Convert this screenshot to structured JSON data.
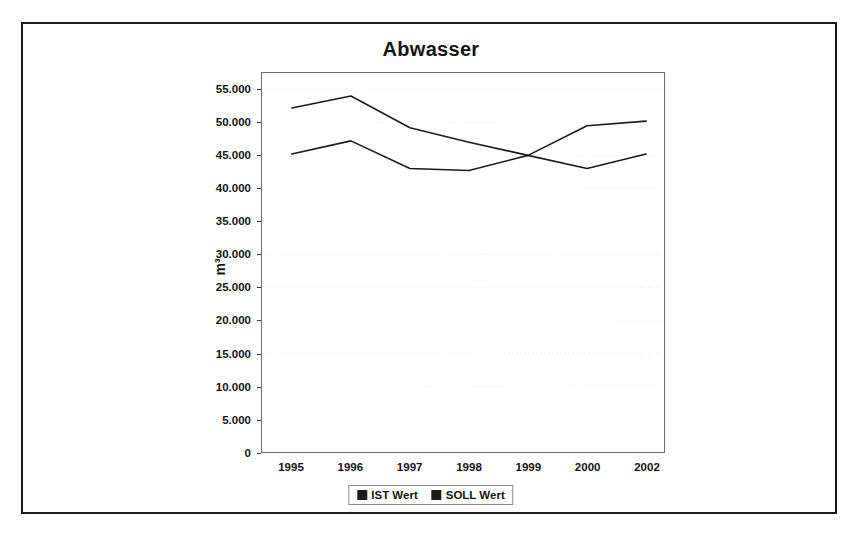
{
  "chart_data": {
    "type": "line",
    "title": "Abwasser",
    "xlabel": "",
    "ylabel": "m³",
    "categories": [
      "1995",
      "1996",
      "1997",
      "1998",
      "1999",
      "2000",
      "2002"
    ],
    "series": [
      {
        "name": "IST Wert",
        "color": "#1b1b1b",
        "values": [
          45200,
          47200,
          43000,
          42700,
          45000,
          43000,
          45200
        ]
      },
      {
        "name": "SOLL Wert",
        "color": "#1b1b1b",
        "values": [
          52200,
          54000,
          49200,
          47000,
          45000,
          49500,
          50200
        ]
      }
    ],
    "ylim": [
      0,
      57500
    ],
    "ytick_values": [
      0,
      5000,
      10000,
      15000,
      20000,
      25000,
      30000,
      35000,
      40000,
      45000,
      50000,
      55000
    ],
    "ytick_labels": [
      "0",
      "5.000",
      "10.000",
      "15.000",
      "20.000",
      "25.000",
      "30.000",
      "35.000",
      "40.000",
      "45.000",
      "50.000",
      "55.000"
    ],
    "grid": true,
    "grid_color": "#e8e8e8",
    "legend_position": "bottom",
    "legend": [
      {
        "label": "IST Wert",
        "swatch": "#1b1b1b"
      },
      {
        "label": "SOLL Wert",
        "swatch": "#1b1b1b"
      }
    ]
  }
}
